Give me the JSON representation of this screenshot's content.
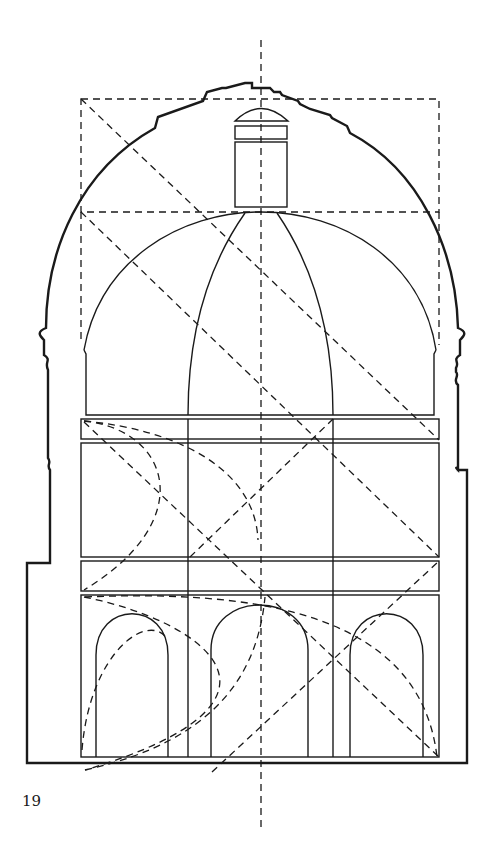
{
  "figure": {
    "number": "19"
  },
  "colors": {
    "background": "#ffffff",
    "ink": "#1a1a1a"
  }
}
